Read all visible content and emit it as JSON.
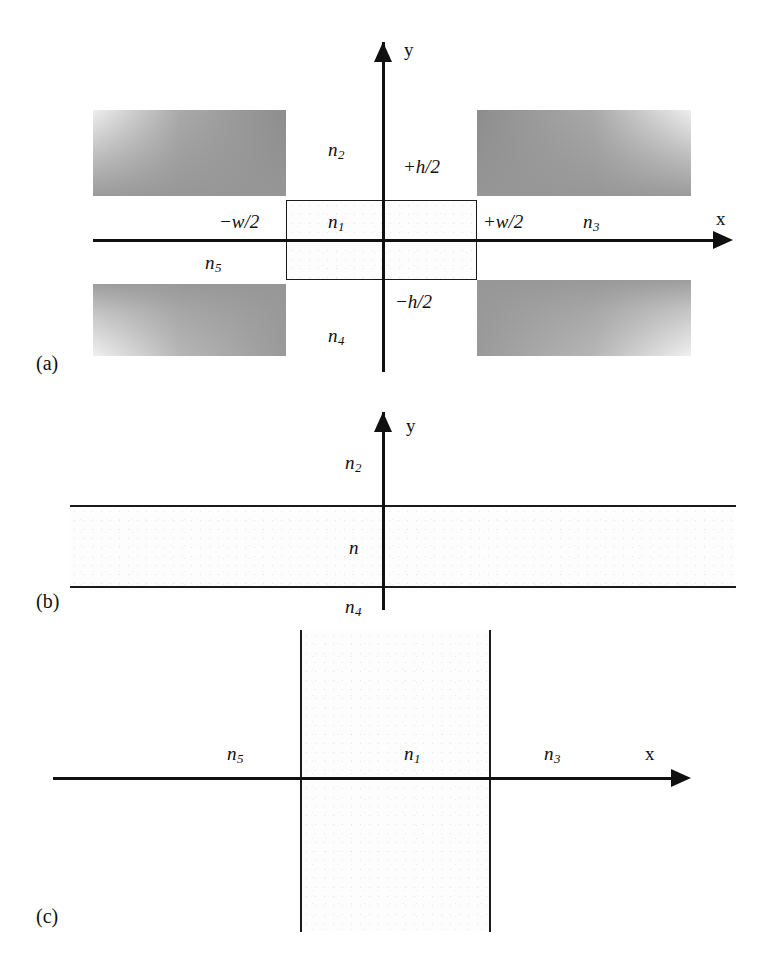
{
  "figure": {
    "type": "optical-waveguide-cross-section-diagram",
    "panels": [
      {
        "tag": "(a)",
        "name": "rectangular-waveguide-cross-section",
        "axes": {
          "x_label": "x",
          "y_label": "y"
        },
        "labels": {
          "core_index": "n",
          "core_index_sub": "1",
          "top_cladding": "n",
          "top_cladding_sub": "2",
          "right_cladding": "n",
          "right_cladding_sub": "3",
          "bottom_cladding": "n",
          "bottom_cladding_sub": "4",
          "left_cladding": "n",
          "left_cladding_sub": "5",
          "top_boundary": "+h/2",
          "bottom_boundary": "−h/2",
          "left_boundary": "−w/2",
          "right_boundary": "+w/2"
        }
      },
      {
        "tag": "(b)",
        "name": "horizontal-slab-waveguide",
        "axes": {
          "y_label": "y"
        },
        "labels": {
          "core_index": "n",
          "top_cladding": "n",
          "top_cladding_sub": "2",
          "bottom_cladding": "n",
          "bottom_cladding_sub": "4"
        }
      },
      {
        "tag": "(c)",
        "name": "vertical-slab-waveguide",
        "axes": {
          "x_label": "x"
        },
        "labels": {
          "core_index": "n",
          "core_index_sub": "1",
          "left_cladding": "n",
          "left_cladding_sub": "5",
          "right_cladding": "n",
          "right_cladding_sub": "3"
        }
      }
    ],
    "colors": {
      "ink": "#111111",
      "line": "#1a1a1a",
      "shade": "#8d8d8d",
      "background": "#ffffff"
    }
  }
}
